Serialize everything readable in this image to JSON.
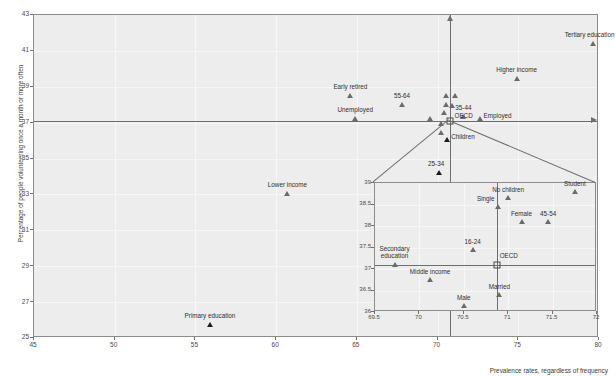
{
  "chart_data": {
    "type": "scatter",
    "title": "",
    "xlabel": "Prevalence rates, regardless of frequency",
    "ylabel": "Percentage of people volunteering once a month or more often",
    "xlim": [
      45,
      80
    ],
    "ylim": [
      25,
      43
    ],
    "xticks": [
      45,
      50,
      55,
      60,
      65,
      70,
      75,
      80
    ],
    "yticks": [
      25,
      27,
      29,
      31,
      33,
      35,
      37,
      39,
      41,
      43
    ],
    "grid": true,
    "legend": "none",
    "reference_lines": {
      "oecd_y": 37.1,
      "oecd_x": 70.8
    },
    "points": [
      {
        "label": "Tertiary education",
        "x": 79.6,
        "y": 41.3,
        "label_pos": "above-left"
      },
      {
        "label": "Higher income",
        "x": 74.9,
        "y": 39.3,
        "label_pos": "above"
      },
      {
        "label": "Early retired",
        "x": 64.6,
        "y": 38.4,
        "label_pos": "above"
      },
      {
        "label": "55-64",
        "x": 67.8,
        "y": 37.9,
        "label_pos": "above"
      },
      {
        "label": "Unemployed",
        "x": 64.9,
        "y": 37.1,
        "label_pos": "above"
      },
      {
        "label": "35-44",
        "x": 71.6,
        "y": 37.2,
        "label_pos": "above"
      },
      {
        "label": "OECD",
        "x": 70.8,
        "y": 37.1,
        "label_pos": "right"
      },
      {
        "label": "Employed",
        "x": 72.6,
        "y": 37.1,
        "label_pos": "right"
      },
      {
        "label": "Children",
        "x": 70.6,
        "y": 35.9,
        "label_pos": "right"
      },
      {
        "label": "25-34",
        "x": 70.1,
        "y": 34.1,
        "label_pos": "above-left"
      },
      {
        "label": "Lower income",
        "x": 60.7,
        "y": 32.9,
        "label_pos": "above"
      },
      {
        "label": "Primary education",
        "x": 55.9,
        "y": 25.6,
        "label_pos": "above"
      },
      {
        "label": "",
        "x": 70.5,
        "y": 38.4,
        "label_pos": "none"
      },
      {
        "label": "",
        "x": 71.1,
        "y": 38.4,
        "label_pos": "none"
      },
      {
        "label": "",
        "x": 70.5,
        "y": 37.9,
        "label_pos": "none"
      },
      {
        "label": "",
        "x": 70.9,
        "y": 37.8,
        "label_pos": "none"
      },
      {
        "label": "",
        "x": 70.4,
        "y": 37.4,
        "label_pos": "none"
      },
      {
        "label": "",
        "x": 70.2,
        "y": 36.8,
        "label_pos": "none"
      },
      {
        "label": "",
        "x": 69.5,
        "y": 37.1,
        "label_pos": "none"
      },
      {
        "label": "",
        "x": 70.2,
        "y": 36.3,
        "label_pos": "none"
      }
    ]
  },
  "inset_chart_data": {
    "type": "scatter",
    "xlim": [
      69.5,
      72
    ],
    "ylim": [
      36,
      39
    ],
    "xticks": [
      69.5,
      70,
      70.5,
      71,
      71.5,
      72
    ],
    "yticks": [
      36,
      36.5,
      37,
      37.5,
      38,
      38.5,
      39
    ],
    "grid": true,
    "reference_lines": {
      "oecd_y": 37.1,
      "oecd_x": 70.87
    },
    "points": [
      {
        "label": "Student",
        "x": 71.75,
        "y": 38.75,
        "label_pos": "above"
      },
      {
        "label": "No children",
        "x": 71.0,
        "y": 38.6,
        "label_pos": "above"
      },
      {
        "label": "Single",
        "x": 70.88,
        "y": 38.4,
        "label_pos": "left"
      },
      {
        "label": "Female",
        "x": 71.15,
        "y": 38.05,
        "label_pos": "above"
      },
      {
        "label": "45-54",
        "x": 71.45,
        "y": 38.05,
        "label_pos": "above"
      },
      {
        "label": "16-24",
        "x": 70.6,
        "y": 37.4,
        "label_pos": "above"
      },
      {
        "label": "OECD",
        "x": 70.87,
        "y": 37.1,
        "label_pos": "above-right"
      },
      {
        "label": "Secondary education",
        "x": 69.72,
        "y": 37.05,
        "label_pos": "above"
      },
      {
        "label": "Middle income",
        "x": 70.12,
        "y": 36.7,
        "label_pos": "above"
      },
      {
        "label": "Married",
        "x": 70.9,
        "y": 36.35,
        "label_pos": "above"
      },
      {
        "label": "Male",
        "x": 70.5,
        "y": 36.1,
        "label_pos": "above"
      }
    ]
  }
}
